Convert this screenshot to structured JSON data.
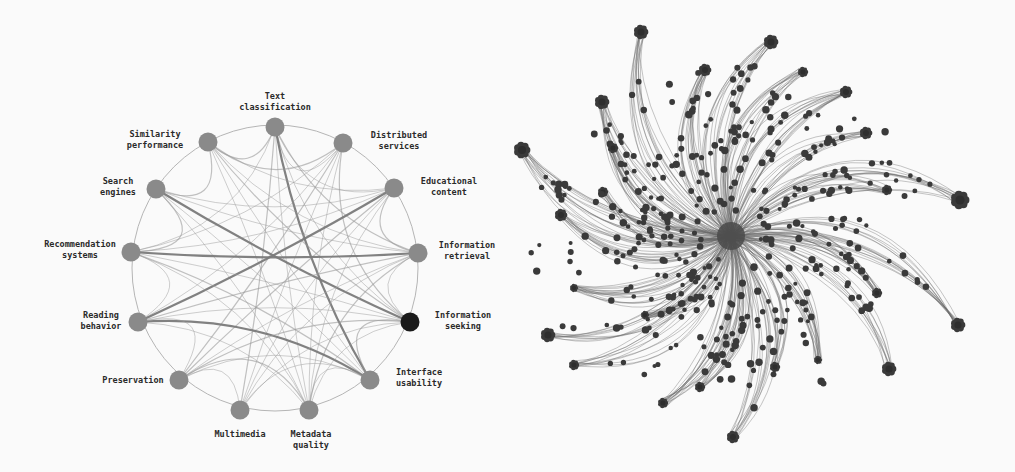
{
  "figure": {
    "left_panel": {
      "type": "circular-topic-network",
      "node_color": "#8a8a8a",
      "highlight_color": "#1a1a1a",
      "edge_color": "#9a9a9a",
      "nodes": [
        {
          "id": "text-classification",
          "label": [
            "Text",
            "classification"
          ],
          "x": 275,
          "y": 127,
          "lx": 275,
          "ly": 99,
          "anchor": "middle"
        },
        {
          "id": "similarity-performance",
          "label": [
            "Similarity",
            "performance"
          ],
          "x": 208,
          "y": 142,
          "lx": 155,
          "ly": 137,
          "anchor": "middle"
        },
        {
          "id": "distributed-services",
          "label": [
            "Distributed",
            "services"
          ],
          "x": 343,
          "y": 143,
          "lx": 399,
          "ly": 138,
          "anchor": "middle"
        },
        {
          "id": "search-engines",
          "label": [
            "Search",
            "engines"
          ],
          "x": 156,
          "y": 189,
          "lx": 118,
          "ly": 184,
          "anchor": "middle"
        },
        {
          "id": "educational-content",
          "label": [
            "Educational",
            "content"
          ],
          "x": 394,
          "y": 188,
          "lx": 449,
          "ly": 184,
          "anchor": "middle"
        },
        {
          "id": "recommendation-systems",
          "label": [
            "Recommendation",
            "systems"
          ],
          "x": 131,
          "y": 252,
          "lx": 80,
          "ly": 247,
          "anchor": "middle"
        },
        {
          "id": "information-retrieval",
          "label": [
            "Information",
            "retrieval"
          ],
          "x": 418,
          "y": 253,
          "lx": 467,
          "ly": 248,
          "anchor": "middle"
        },
        {
          "id": "reading-behavior",
          "label": [
            "Reading",
            "behavior"
          ],
          "x": 138,
          "y": 322,
          "lx": 101,
          "ly": 318,
          "anchor": "middle"
        },
        {
          "id": "information-seeking",
          "label": [
            "Information",
            "seeking"
          ],
          "x": 410,
          "y": 322,
          "lx": 463,
          "ly": 318,
          "anchor": "middle",
          "highlight": true
        },
        {
          "id": "preservation",
          "label": [
            "Preservation"
          ],
          "x": 179,
          "y": 380,
          "lx": 133,
          "ly": 383,
          "anchor": "middle"
        },
        {
          "id": "interface-usability",
          "label": [
            "Interface",
            "usability"
          ],
          "x": 370,
          "y": 380,
          "lx": 419,
          "ly": 375,
          "anchor": "middle"
        },
        {
          "id": "multimedia",
          "label": [
            "Multimedia"
          ],
          "x": 240,
          "y": 410,
          "lx": 240,
          "ly": 437,
          "anchor": "middle"
        },
        {
          "id": "metadata-quality",
          "label": [
            "Metadata",
            "quality"
          ],
          "x": 309,
          "y": 410,
          "lx": 311,
          "ly": 437,
          "anchor": "middle"
        }
      ],
      "edges": [
        [
          0,
          1
        ],
        [
          0,
          2
        ],
        [
          0,
          4
        ],
        [
          0,
          6
        ],
        [
          0,
          8
        ],
        [
          0,
          10
        ],
        [
          0,
          11
        ],
        [
          0,
          12
        ],
        [
          0,
          5
        ],
        [
          1,
          2
        ],
        [
          1,
          4
        ],
        [
          1,
          6
        ],
        [
          1,
          8
        ],
        [
          1,
          10
        ],
        [
          1,
          12
        ],
        [
          1,
          3
        ],
        [
          2,
          5
        ],
        [
          2,
          7
        ],
        [
          2,
          9
        ],
        [
          2,
          11
        ],
        [
          2,
          12
        ],
        [
          2,
          8
        ],
        [
          3,
          4
        ],
        [
          3,
          6
        ],
        [
          3,
          8
        ],
        [
          3,
          10
        ],
        [
          3,
          12
        ],
        [
          3,
          5
        ],
        [
          4,
          5
        ],
        [
          4,
          7
        ],
        [
          4,
          9
        ],
        [
          4,
          11
        ],
        [
          4,
          12
        ],
        [
          4,
          6
        ],
        [
          5,
          6
        ],
        [
          5,
          8
        ],
        [
          5,
          10
        ],
        [
          5,
          12
        ],
        [
          5,
          7
        ],
        [
          6,
          7
        ],
        [
          6,
          9
        ],
        [
          6,
          11
        ],
        [
          6,
          12
        ],
        [
          6,
          8
        ],
        [
          7,
          8
        ],
        [
          7,
          10
        ],
        [
          7,
          12
        ],
        [
          7,
          9
        ],
        [
          8,
          9
        ],
        [
          8,
          11
        ],
        [
          8,
          12
        ],
        [
          8,
          10
        ],
        [
          9,
          10
        ],
        [
          9,
          11
        ],
        [
          9,
          12
        ],
        [
          10,
          11
        ],
        [
          10,
          12
        ]
      ],
      "heavy_edges": [
        [
          3,
          8
        ],
        [
          4,
          7
        ],
        [
          5,
          6
        ],
        [
          0,
          10
        ],
        [
          7,
          10
        ],
        [
          9,
          8
        ],
        [
          11,
          10
        ]
      ]
    },
    "right_panel": {
      "type": "radial-bundled-network",
      "hub": {
        "x": 731,
        "y": 236
      },
      "node_color": "#3a3a3a",
      "edge_color": "#6a6a6a",
      "clusters": [
        {
          "x": 641,
          "y": 32,
          "r": 7
        },
        {
          "x": 771,
          "y": 42,
          "r": 7
        },
        {
          "x": 705,
          "y": 70,
          "r": 6
        },
        {
          "x": 803,
          "y": 72,
          "r": 5
        },
        {
          "x": 846,
          "y": 92,
          "r": 6
        },
        {
          "x": 602,
          "y": 102,
          "r": 7
        },
        {
          "x": 866,
          "y": 133,
          "r": 6
        },
        {
          "x": 522,
          "y": 150,
          "r": 8
        },
        {
          "x": 613,
          "y": 148,
          "r": 5
        },
        {
          "x": 603,
          "y": 192,
          "r": 5
        },
        {
          "x": 561,
          "y": 215,
          "r": 6
        },
        {
          "x": 887,
          "y": 190,
          "r": 5
        },
        {
          "x": 960,
          "y": 200,
          "r": 9
        },
        {
          "x": 548,
          "y": 335,
          "r": 7
        },
        {
          "x": 574,
          "y": 365,
          "r": 5
        },
        {
          "x": 663,
          "y": 403,
          "r": 5
        },
        {
          "x": 700,
          "y": 387,
          "r": 5
        },
        {
          "x": 733,
          "y": 437,
          "r": 6
        },
        {
          "x": 775,
          "y": 367,
          "r": 5
        },
        {
          "x": 818,
          "y": 360,
          "r": 4
        },
        {
          "x": 889,
          "y": 369,
          "r": 7
        },
        {
          "x": 958,
          "y": 325,
          "r": 7
        },
        {
          "x": 877,
          "y": 293,
          "r": 5
        },
        {
          "x": 645,
          "y": 315,
          "r": 4
        },
        {
          "x": 574,
          "y": 288,
          "r": 4
        }
      ]
    }
  }
}
